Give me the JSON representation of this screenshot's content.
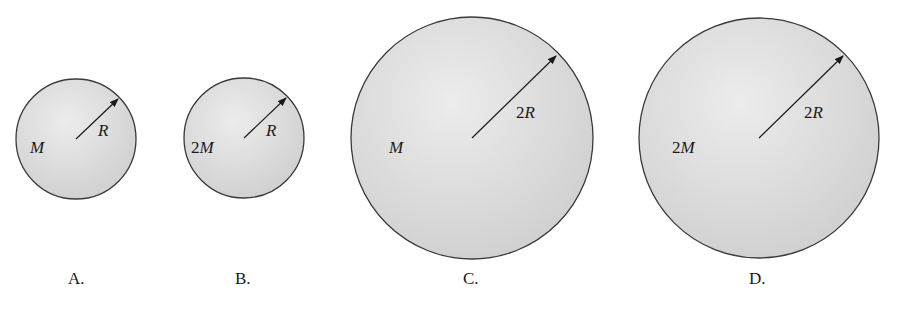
{
  "diagram": {
    "colors": {
      "sphere_fill_center": "#ececec",
      "sphere_fill_edge": "#cfcfcf",
      "sphere_stroke": "#3a3a3a",
      "text": "#1a1a1a",
      "background": "#ffffff"
    },
    "spheres": [
      {
        "option": "A.",
        "mass_coef": "",
        "mass_symbol": "M",
        "radius_coef": "",
        "radius_symbol": "R",
        "cx": 76,
        "cy": 139,
        "r": 60
      },
      {
        "option": "B.",
        "mass_coef": "2",
        "mass_symbol": "M",
        "radius_coef": "",
        "radius_symbol": "R",
        "cx": 244,
        "cy": 138,
        "r": 60
      },
      {
        "option": "C.",
        "mass_coef": "",
        "mass_symbol": "M",
        "radius_coef": "2",
        "radius_symbol": "R",
        "cx": 472,
        "cy": 138,
        "r": 121
      },
      {
        "option": "D.",
        "mass_coef": "2",
        "mass_symbol": "M",
        "radius_coef": "2",
        "radius_symbol": "R",
        "cx": 759,
        "cy": 138,
        "r": 120
      }
    ]
  }
}
